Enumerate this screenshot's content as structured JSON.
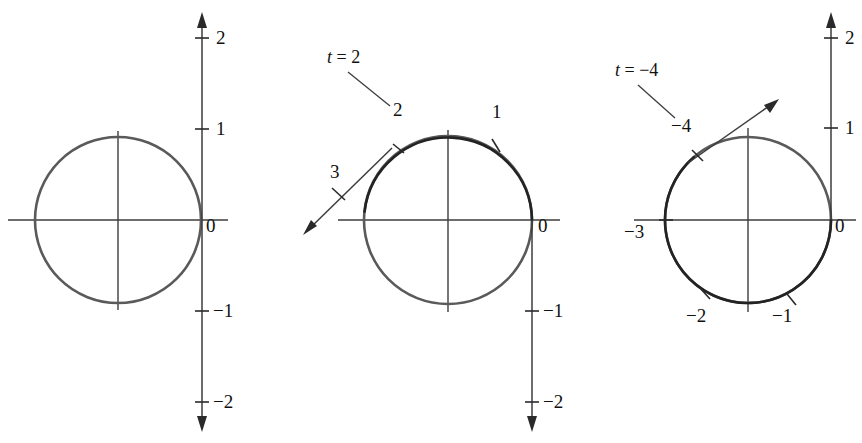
{
  "figure": {
    "type": "diagram",
    "panels": [
      {
        "id": "panel-1",
        "name": "unit-circle-plain",
        "circle": {
          "cx": 118,
          "cy": 220,
          "r": 83
        },
        "number_line": {
          "x": 202,
          "orientation": "vertical",
          "arrows": "both"
        },
        "axis_ticks": [
          {
            "label": "2",
            "y": 38
          },
          {
            "label": "1",
            "y": 129
          },
          {
            "label": "0",
            "y": 220
          },
          {
            "label": "−1",
            "y": 311
          },
          {
            "label": "−2",
            "y": 402
          }
        ],
        "circle_ticks": [],
        "annotation": null
      },
      {
        "id": "panel-2",
        "name": "unit-circle-wrap-positive",
        "circle": {
          "cx": 448,
          "cy": 220,
          "r": 84
        },
        "number_line": {
          "x": 532,
          "orientation": "vertical-down",
          "arrows": "down"
        },
        "axis_ticks": [
          {
            "label": "0",
            "y": 220
          },
          {
            "label": "−1",
            "y": 311
          },
          {
            "label": "−2",
            "y": 402
          }
        ],
        "circle_ticks": [
          {
            "label": "1",
            "t": 1
          },
          {
            "label": "2",
            "t": 2
          }
        ],
        "tangent_tick": {
          "label": "3",
          "t": 3
        },
        "annotation": {
          "label": "t = 2",
          "points_to": "2"
        }
      },
      {
        "id": "panel-3",
        "name": "unit-circle-wrap-negative",
        "circle": {
          "cx": 748,
          "cy": 220,
          "r": 83
        },
        "number_line": {
          "x": 831,
          "orientation": "vertical-up",
          "arrows": "up"
        },
        "axis_ticks": [
          {
            "label": "2",
            "y": 38
          },
          {
            "label": "1",
            "y": 128
          },
          {
            "label": "0",
            "y": 220
          }
        ],
        "circle_ticks": [
          {
            "label": "−1",
            "t": -1
          },
          {
            "label": "−2",
            "t": -2
          },
          {
            "label": "−3",
            "t": -3
          },
          {
            "label": "−4",
            "t": -4
          }
        ],
        "annotation": {
          "label": "t = −4",
          "points_to": "−4"
        }
      }
    ],
    "labels": {
      "p1_2": "2",
      "p1_1": "1",
      "p1_0": "0",
      "p1_m1": "−1",
      "p1_m2": "−2",
      "p2_t_eq": "t = 2",
      "p2_2": "2",
      "p2_1": "1",
      "p2_3": "3",
      "p2_0": "0",
      "p2_m1": "−1",
      "p2_m2": "−2",
      "p3_t_eq": "t = −4",
      "p3_m4": "−4",
      "p3_m3": "−3",
      "p3_m2": "−2",
      "p3_m1": "−1",
      "p3_0": "0",
      "p3_1": "1",
      "p3_2": "2"
    },
    "colors": {
      "circle_light": "#5a5a5a",
      "circle_dark": "#232323",
      "axis": "#3d3d3d",
      "text": "#111111",
      "background": "#ffffff"
    }
  }
}
